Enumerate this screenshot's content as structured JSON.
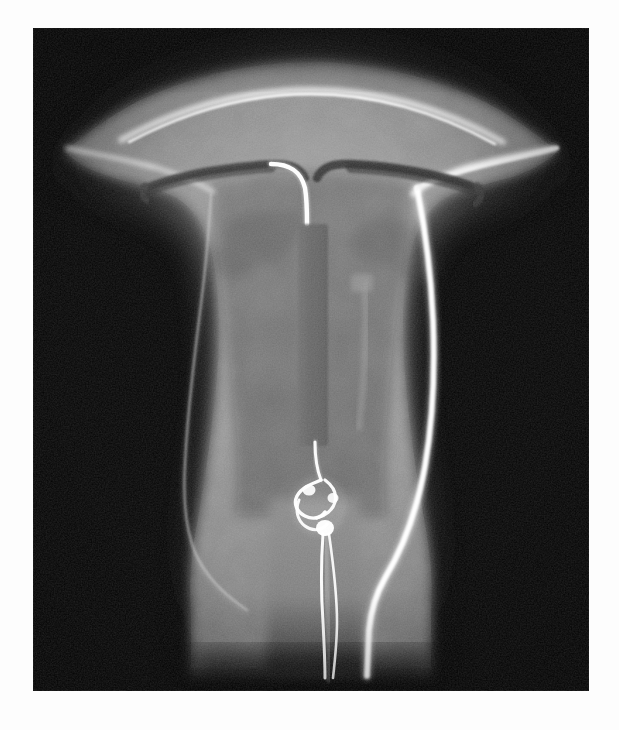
{
  "document": {
    "kind": "radiograph",
    "modality": "plain-film-radiograph",
    "subject": "uterus-specimen-with-intrauterine-device",
    "orientation": "coronal-anterior-posterior",
    "background_color": "#050505",
    "page_background_color": "#fdfdfd",
    "plate": {
      "x": 33,
      "y": 28,
      "width": 556,
      "height": 663,
      "border_color": "#fdfdfd"
    }
  },
  "palette": {
    "film_black": "#050505",
    "soft_tissue_outer": "#5a5a5a",
    "myometrium": "#8d8d8d",
    "myometrium_light": "#9a9a9a",
    "endometrial_cavity": "#6e6e6e",
    "cavity_dark": "#5f5f5f",
    "radiopaque_bright": "#f2f2f2",
    "radiopaque_white": "#ffffff",
    "device_shadow": "#3a3a3a",
    "device_stem": "#474747",
    "faint_line": "#c8c8c8"
  },
  "anatomy": {
    "structures": [
      {
        "name": "uterine-fundus",
        "description": "broad convex superior border of the uterine corpus"
      },
      {
        "name": "uterine-cornua-left",
        "description": "left superolateral horn tapering to the tubal ostium"
      },
      {
        "name": "uterine-cornua-right",
        "description": "right superolateral horn tapering to the tubal ostium"
      },
      {
        "name": "myometrium",
        "description": "mid-grey muscular wall surrounding the cavity"
      },
      {
        "name": "endometrial-cavity",
        "description": "darker triangular central cavity"
      },
      {
        "name": "uterine-isthmus",
        "description": "narrowed lower segment"
      },
      {
        "name": "cervical-canal",
        "description": "inferior tubular canal exiting the plate"
      },
      {
        "name": "serosal-outline-left",
        "description": "thin bright line along the left serosal surface"
      },
      {
        "name": "serosal-outline-right",
        "description": "thick bright radiopaque line along the right serosal surface"
      }
    ]
  },
  "device": {
    "type": "intrauterine-device",
    "shape": "T-shaped",
    "components": [
      {
        "name": "iud-transverse-arm-left",
        "appearance": "dark radiolucent horizontal limb extending to the left cornu"
      },
      {
        "name": "iud-transverse-arm-right",
        "appearance": "dark radiolucent horizontal limb extending to the right cornu"
      },
      {
        "name": "iud-vertical-stem",
        "appearance": "bright radiopaque vertical stem descending from the arm junction"
      },
      {
        "name": "iud-reservoir-sleeve",
        "appearance": "elongated rectangular sleeve along the upper two-thirds of the stem"
      },
      {
        "name": "iud-strings-knot",
        "appearance": "looped and knotted monofilament tail at the stem tip"
      },
      {
        "name": "iud-strings-tail",
        "appearance": "two fine radiopaque filaments descending through the cervical canal"
      }
    ]
  },
  "instrumentation": {
    "items": [
      {
        "name": "radiopaque-catheter",
        "path": "enters at the right cornu, courses inferiorly along the right uterine margin and exits at the cervix"
      },
      {
        "name": "faint-linear-streak",
        "path": "vertical low-density streak in the right half of the cavity"
      }
    ]
  },
  "chart_data": {
    "type": "heatmap",
    "title": "",
    "xlabel": "",
    "ylabel": "",
    "value_unit": "relative-radiodensity-0-255",
    "regions": [
      {
        "label": "film background",
        "value": 8
      },
      {
        "label": "soft tissue halo",
        "value": 52
      },
      {
        "label": "outer myometrium",
        "value": 128
      },
      {
        "label": "inner myometrium",
        "value": 150
      },
      {
        "label": "endometrial cavity",
        "value": 108
      },
      {
        "label": "IUD arms (radiolucent)",
        "value": 58
      },
      {
        "label": "IUD stem (radiopaque)",
        "value": 248
      },
      {
        "label": "catheter",
        "value": 252
      },
      {
        "label": "strings / knot",
        "value": 244
      }
    ]
  }
}
